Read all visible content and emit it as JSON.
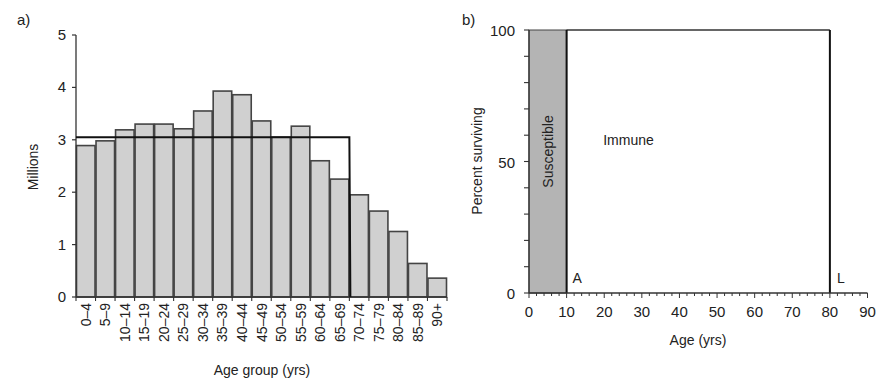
{
  "chart_data": [
    {
      "panel_label": "a)",
      "type": "bar",
      "title": "",
      "xlabel": "Age group (yrs)",
      "ylabel": "Millions",
      "ylim": [
        0,
        5
      ],
      "yticks": [
        "0",
        "1",
        "2",
        "3",
        "4",
        "5"
      ],
      "grid": false,
      "categories": [
        "0–4",
        "5–9",
        "10–14",
        "15–19",
        "20–24",
        "25–29",
        "30–34",
        "35–39",
        "40–44",
        "45–49",
        "50–54",
        "55–59",
        "60–64",
        "65–69",
        "70–74",
        "75–79",
        "80–84",
        "85–89",
        "90+"
      ],
      "values": [
        2.89,
        2.98,
        3.19,
        3.3,
        3.3,
        3.21,
        3.55,
        3.93,
        3.86,
        3.36,
        3.05,
        3.26,
        2.6,
        2.25,
        1.95,
        1.64,
        1.25,
        0.64,
        0.36
      ],
      "overlay": {
        "description": "Rectangular (type I) age distribution line",
        "level": 3.05,
        "drop_after_category": "65–69"
      },
      "colors": {
        "bar_fill": "#d0d0d0",
        "bar_edge": "#444444",
        "line": "#111111"
      }
    },
    {
      "panel_label": "b)",
      "type": "area",
      "title": "",
      "xlabel": "Age (yrs)",
      "ylabel": "Percent surviving",
      "xlim": [
        0,
        90
      ],
      "ylim": [
        0,
        100
      ],
      "xticks": [
        "0",
        "10",
        "20",
        "30",
        "40",
        "50",
        "60",
        "70",
        "80",
        "90"
      ],
      "yticks": [
        "0",
        "50",
        "100"
      ],
      "grid": false,
      "series": [
        {
          "name": "Susceptible",
          "x": [
            0,
            10
          ],
          "y": [
            100,
            100
          ],
          "fill": "#b4b4b4"
        },
        {
          "name": "Immune",
          "x": [
            10,
            80
          ],
          "y": [
            100,
            100
          ],
          "fill": "#ffffff"
        }
      ],
      "annotations": [
        {
          "text": "Susceptible",
          "x": 5,
          "y": 50,
          "rotation": -90
        },
        {
          "text": "Immune",
          "x": 20,
          "y": 58
        },
        {
          "text": "A",
          "x": 11,
          "y": 8
        },
        {
          "text": "L",
          "x": 81,
          "y": 8
        }
      ],
      "vertical_lines": [
        10,
        80
      ]
    }
  ],
  "labels": {
    "panel_a": "a)",
    "panel_b": "b)",
    "a_ylabel": "Millions",
    "a_xlabel": "Age group (yrs)",
    "b_ylabel": "Percent surviving",
    "b_xlabel": "Age (yrs)",
    "susceptible": "Susceptible",
    "immune": "Immune",
    "mark_a": "A",
    "mark_l": "L"
  }
}
